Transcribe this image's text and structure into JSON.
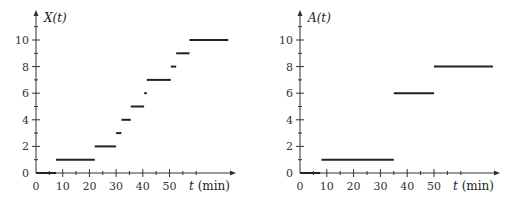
{
  "chart_data": [
    {
      "type": "line",
      "subtype": "step",
      "title": "",
      "ylabel": "X(t)",
      "xlabel": "t (min)",
      "xticks": [
        0,
        10,
        20,
        30,
        40,
        50
      ],
      "yticks": [
        0,
        2,
        4,
        6,
        8,
        10
      ],
      "xlim": [
        0,
        73
      ],
      "ylim": [
        0,
        11.5
      ],
      "grid": false,
      "segments": [
        {
          "y": 0,
          "x0": 0,
          "x1": 7.5
        },
        {
          "y": 1,
          "x0": 7.5,
          "x1": 22
        },
        {
          "y": 2,
          "x0": 22,
          "x1": 30
        },
        {
          "y": 3,
          "x0": 30,
          "x1": 32
        },
        {
          "y": 4,
          "x0": 32,
          "x1": 35.5
        },
        {
          "y": 5,
          "x0": 35.5,
          "x1": 40.5
        },
        {
          "y": 6,
          "x0": 40.5,
          "x1": 41.5
        },
        {
          "y": 7,
          "x0": 41.5,
          "x1": 50.5
        },
        {
          "y": 8,
          "x0": 50.5,
          "x1": 52.5
        },
        {
          "y": 9,
          "x0": 52.5,
          "x1": 57.5
        },
        {
          "y": 10,
          "x0": 57.5,
          "x1": 72
        }
      ]
    },
    {
      "type": "line",
      "subtype": "step",
      "title": "",
      "ylabel": "A(t)",
      "xlabel": "t (min)",
      "xticks": [
        0,
        10,
        20,
        30,
        40,
        50
      ],
      "yticks": [
        0,
        2,
        4,
        6,
        8,
        10
      ],
      "xlim": [
        0,
        73
      ],
      "ylim": [
        0,
        11.5
      ],
      "grid": false,
      "segments": [
        {
          "y": 0,
          "x0": 0,
          "x1": 7.5
        },
        {
          "y": 1,
          "x0": 8,
          "x1": 35
        },
        {
          "y": 6,
          "x0": 35,
          "x1": 50
        },
        {
          "y": 8,
          "x0": 50,
          "x1": 72
        }
      ]
    }
  ],
  "labels": {
    "left_ylabel": "X(t)",
    "right_ylabel": "A(t)",
    "xlabel_var": "t",
    "xlabel_unit": "(min)"
  }
}
